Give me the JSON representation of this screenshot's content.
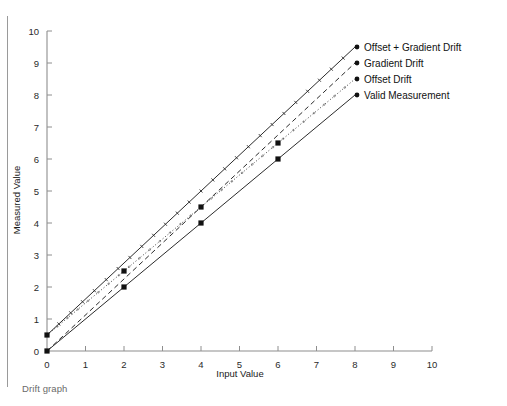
{
  "figure": {
    "caption": "Drift graph"
  },
  "chart_data": {
    "type": "line",
    "title": "",
    "xlabel": "Input Value",
    "ylabel": "Measured Value",
    "xlim": [
      0,
      10
    ],
    "ylim": [
      0,
      10
    ],
    "xticks": [
      0,
      1,
      2,
      3,
      4,
      5,
      6,
      7,
      8,
      9,
      10
    ],
    "yticks": [
      0,
      1,
      2,
      3,
      4,
      5,
      6,
      7,
      8,
      9,
      10
    ],
    "xticklabels": [
      "0",
      "1",
      "2",
      "3",
      "4",
      "5",
      "6",
      "7",
      "8",
      "9",
      "10"
    ],
    "yticklabels": [
      "0",
      "1",
      "2",
      "3",
      "4",
      "5",
      "6",
      "7",
      "8",
      "9",
      "10"
    ],
    "grid": false,
    "legend_position": "right-endpoint-labels",
    "series": [
      {
        "name": "Offset + Gradient Drift",
        "style": "hashed",
        "intercept": 0.5,
        "slope": 1.125,
        "x": [
          0,
          8
        ],
        "values": [
          0.5,
          9.5
        ],
        "markers": []
      },
      {
        "name": "Gradient Drift",
        "style": "dashed",
        "intercept": 0.0,
        "slope": 1.125,
        "x": [
          0,
          8
        ],
        "values": [
          0.0,
          9.0
        ],
        "markers": []
      },
      {
        "name": "Offset Drift",
        "style": "dotted",
        "intercept": 0.5,
        "slope": 1.0,
        "x": [
          0,
          8
        ],
        "values": [
          0.5,
          8.5
        ],
        "markers": [
          {
            "x": 0,
            "y": 0.5
          },
          {
            "x": 2,
            "y": 2.5
          },
          {
            "x": 4,
            "y": 4.5
          },
          {
            "x": 6,
            "y": 6.5
          }
        ]
      },
      {
        "name": "Valid Measurement",
        "style": "solid",
        "intercept": 0.0,
        "slope": 1.0,
        "x": [
          0,
          8
        ],
        "values": [
          0.0,
          8.0
        ],
        "markers": [
          {
            "x": 0,
            "y": 0.0
          },
          {
            "x": 2,
            "y": 2.0
          },
          {
            "x": 4,
            "y": 4.0
          },
          {
            "x": 6,
            "y": 6.0
          }
        ]
      }
    ],
    "legend_entries": [
      "Offset + Gradient Drift",
      "Gradient Drift",
      "Offset Drift",
      "Valid Measurement"
    ],
    "colors": {
      "line": "#2b2b2b",
      "axis": "#8e8e8e",
      "text": "#1a1a1a",
      "caption": "#6a6a6a",
      "background": "#ffffff"
    }
  }
}
